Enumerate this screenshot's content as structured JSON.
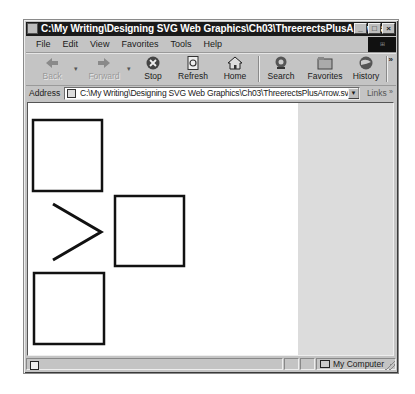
{
  "window": {
    "title": "C:\\My Writing\\Designing SVG Web Graphics\\Ch03\\ThreerectsPlusArrow.svg",
    "controls": {
      "minimize": "_",
      "maximize": "□",
      "close": "×"
    }
  },
  "menubar": {
    "items": [
      {
        "label": "File"
      },
      {
        "label": "Edit"
      },
      {
        "label": "View"
      },
      {
        "label": "Favorites"
      },
      {
        "label": "Tools"
      },
      {
        "label": "Help"
      }
    ]
  },
  "toolbar": {
    "buttons": [
      {
        "label": "Back",
        "icon": "back-arrow-icon",
        "enabled": false
      },
      {
        "label": "Forward",
        "icon": "forward-arrow-icon",
        "enabled": false
      },
      {
        "label": "Stop",
        "icon": "stop-icon",
        "enabled": true
      },
      {
        "label": "Refresh",
        "icon": "refresh-icon",
        "enabled": true
      },
      {
        "label": "Home",
        "icon": "home-icon",
        "enabled": true
      },
      {
        "label": "Search",
        "icon": "search-icon",
        "enabled": true
      },
      {
        "label": "Favorites",
        "icon": "favorites-icon",
        "enabled": true
      },
      {
        "label": "History",
        "icon": "history-icon",
        "enabled": true
      }
    ],
    "overflow": "»"
  },
  "addressbar": {
    "label": "Address",
    "value": "C:\\My Writing\\Designing SVG Web Graphics\\Ch03\\ThreerectsPlusArrow.svg",
    "links_label": "Links",
    "links_overflow": "»"
  },
  "content": {
    "shapes": {
      "rects": [
        {
          "x": 5,
          "y": 17,
          "w": 69,
          "h": 71
        },
        {
          "x": 87,
          "y": 93,
          "w": 69,
          "h": 70
        },
        {
          "x": 6,
          "y": 170,
          "w": 70,
          "h": 71
        }
      ],
      "arrow": {
        "points": "25,101 73,129 25,157"
      },
      "stroke": "#111111"
    },
    "side_pane_color": "#dcdcdc"
  },
  "statusbar": {
    "zone": "My Computer"
  }
}
